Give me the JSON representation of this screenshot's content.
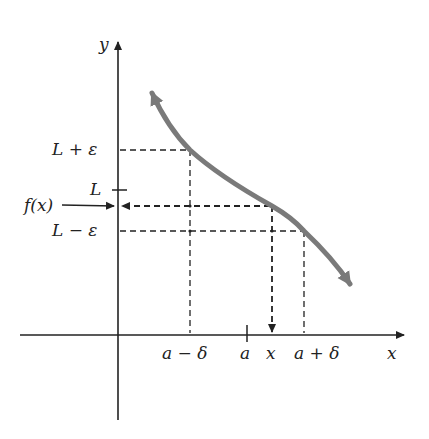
{
  "figure": {
    "axes": {
      "x_label": "x",
      "y_label": "y"
    },
    "y_labels": {
      "upper": "L + ε",
      "limit": "L",
      "f_value": "f(x)",
      "lower": "L − ε"
    },
    "x_labels": {
      "left": "a − δ",
      "center": "a",
      "point": "x",
      "right": "a + δ"
    },
    "colors": {
      "curve": "#7a7a7a",
      "axes": "#222222",
      "guides": "#222222",
      "background": "#ffffff"
    }
  }
}
